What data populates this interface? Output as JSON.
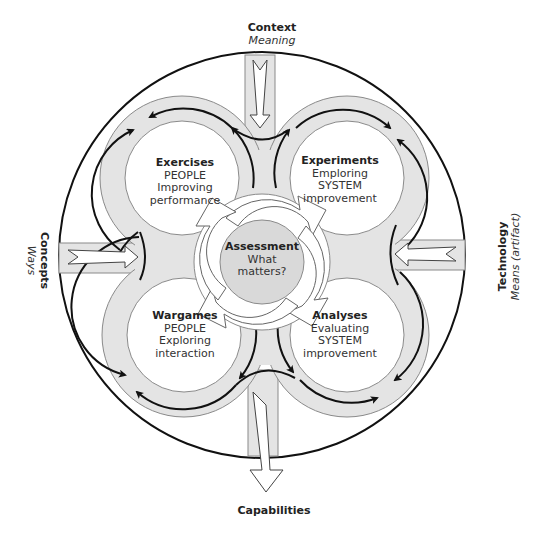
{
  "colors": {
    "ring_fill": "#e4e4e4",
    "ring_stroke": "#8a8a8a",
    "inner_fill": "#ffffff",
    "outline": "#111111",
    "assessment_fill": "#d9d9d9",
    "text": "#222222"
  },
  "inputs": {
    "top": {
      "title": "Context",
      "subtitle": "Meaning"
    },
    "left": {
      "title": "Concepts",
      "subtitle": "Ways"
    },
    "right": {
      "title": "Technology",
      "subtitle": "Means (artifact)"
    },
    "bottom": {
      "title": "Capabilities"
    }
  },
  "quadrants": [
    {
      "id": "exercises",
      "title": "Exercises",
      "lines": [
        "PEOPLE",
        "Improving",
        "performance"
      ]
    },
    {
      "id": "experiments",
      "title": "Experiments",
      "lines": [
        "Emploring",
        "SYSTEM",
        "improvement"
      ]
    },
    {
      "id": "wargames",
      "title": "Wargames",
      "lines": [
        "PEOPLE",
        "Exploring",
        "interaction"
      ]
    },
    {
      "id": "analyses",
      "title": "Analyses",
      "lines": [
        "Evaluating",
        "SYSTEM",
        "improvement"
      ]
    }
  ],
  "center": {
    "title": "Assessment",
    "lines": [
      "What",
      "matters?"
    ]
  }
}
